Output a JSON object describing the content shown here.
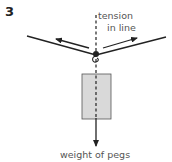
{
  "figure": {
    "number": "3",
    "labels": {
      "tension_line1": "tension",
      "tension_line2": "in line",
      "weight": "weight of pegs"
    },
    "colors": {
      "stroke": "#222222",
      "box_fill": "#d9d9d9",
      "box_stroke": "#555555",
      "text": "#555555"
    }
  }
}
